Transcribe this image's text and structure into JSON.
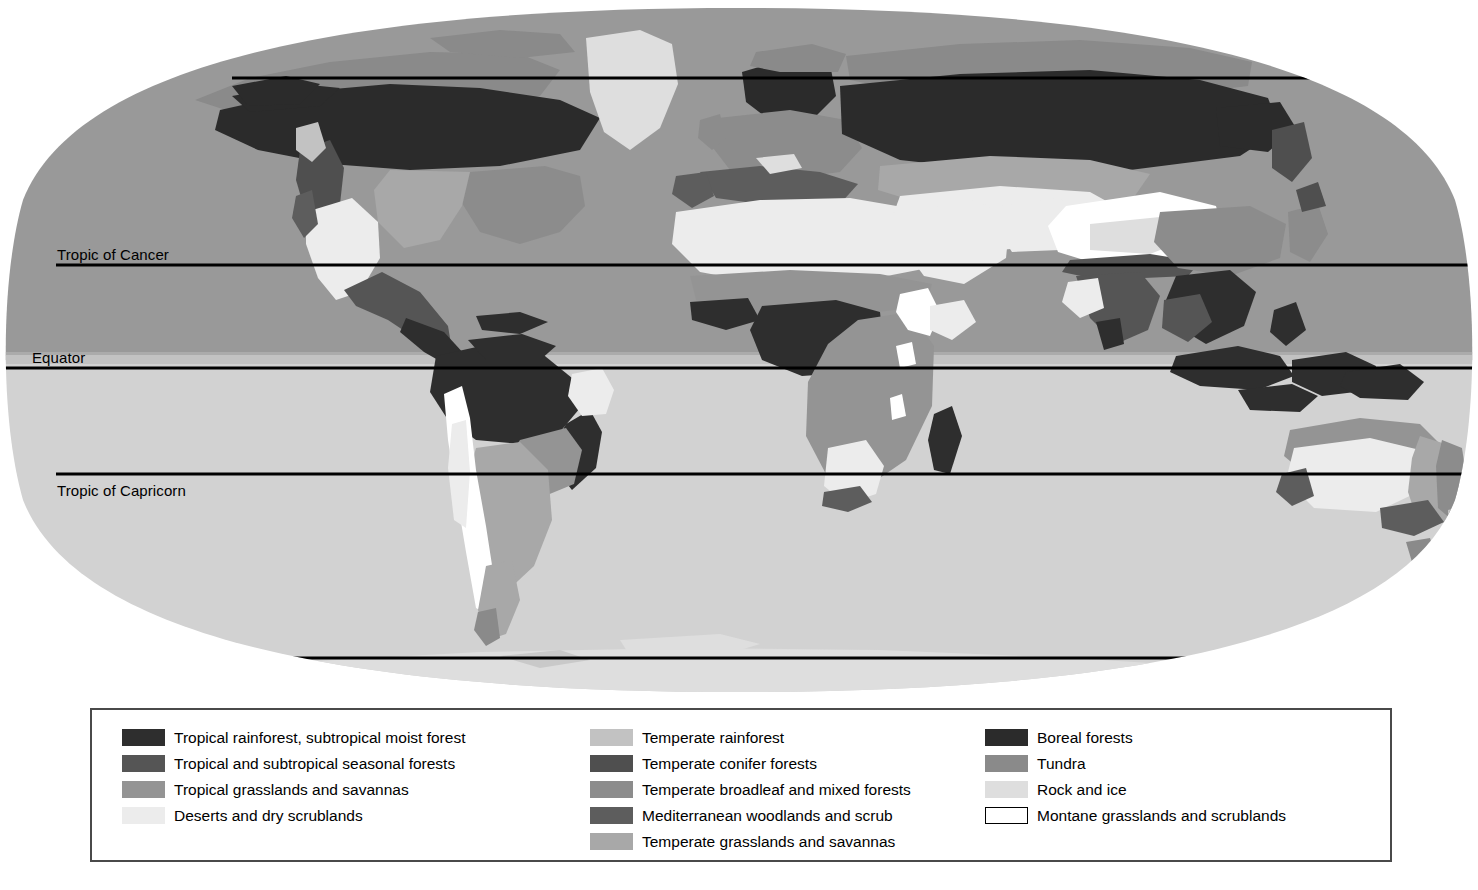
{
  "figure": {
    "kind": "world-biome-map",
    "projection": "oval (Robinson-style) world projection"
  },
  "map": {
    "ocean_north_color": "#999999",
    "ocean_south_color": "#d2d2d2",
    "page_background": "#ffffff",
    "graticule_color": "#000000",
    "latitude_lines": [
      {
        "name": "arctic-circle",
        "label": "",
        "y_px": 78,
        "width": "full"
      },
      {
        "name": "tropic-of-cancer",
        "label": "Tropic of Cancer",
        "y_px": 265,
        "width": "full"
      },
      {
        "name": "equator",
        "label": "Equator",
        "y_px": 368,
        "width": "full"
      },
      {
        "name": "tropic-of-capricorn",
        "label": "Tropic of Capricorn",
        "y_px": 474,
        "width": "full"
      },
      {
        "name": "antarctic-circle",
        "label": "",
        "y_px": 658,
        "width": "inset"
      }
    ],
    "labels": {
      "tropic_of_cancer": "Tropic of Cancer",
      "equator": "Equator",
      "tropic_of_capricorn": "Tropic of Capricorn"
    }
  },
  "legend": {
    "columns": [
      {
        "name": "tropical-and-desert-biomes",
        "items": [
          {
            "label": "Tropical rainforest, subtropical moist forest",
            "color": "#2e2e2e",
            "outlined": false
          },
          {
            "label": "Tropical and subtropical seasonal forests",
            "color": "#555555",
            "outlined": false
          },
          {
            "label": "Tropical grasslands and savannas",
            "color": "#949494",
            "outlined": false
          },
          {
            "label": "Deserts and dry scrublands",
            "color": "#ececec",
            "outlined": false
          }
        ]
      },
      {
        "name": "temperate-biomes",
        "items": [
          {
            "label": "Temperate rainforest",
            "color": "#c2c2c2",
            "outlined": false
          },
          {
            "label": "Temperate conifer forests",
            "color": "#4f4f4f",
            "outlined": false
          },
          {
            "label": "Temperate broadleaf and mixed forests",
            "color": "#8c8c8c",
            "outlined": false
          },
          {
            "label": "Mediterranean woodlands and scrub",
            "color": "#5d5d5d",
            "outlined": false
          },
          {
            "label": "Temperate grasslands and savannas",
            "color": "#a8a8a8",
            "outlined": false
          }
        ]
      },
      {
        "name": "boreal-polar-and-montane-biomes",
        "items": [
          {
            "label": "Boreal forests",
            "color": "#2b2b2b",
            "outlined": false
          },
          {
            "label": "Tundra",
            "color": "#8a8a8a",
            "outlined": false
          },
          {
            "label": "Rock and ice",
            "color": "#dedede",
            "outlined": false
          },
          {
            "label": "Montane grasslands and scrublands",
            "color": "#ffffff",
            "outlined": true
          }
        ]
      }
    ]
  }
}
